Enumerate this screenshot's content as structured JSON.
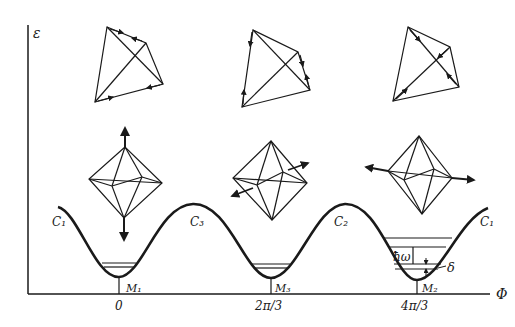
{
  "axes": {
    "y_label": "ε",
    "x_label": "Φ"
  },
  "ticks": [
    {
      "label": "0",
      "x": 119
    },
    {
      "label": "2π/3",
      "x": 271
    },
    {
      "label": "4π/3",
      "x": 417
    }
  ],
  "minima": [
    {
      "label": "M₁",
      "x": 119
    },
    {
      "label": "M₃",
      "x": 271
    },
    {
      "label": "M₂",
      "x": 417
    }
  ],
  "curve_labels": [
    {
      "label": "C₁",
      "position": "left"
    },
    {
      "label": "C₃",
      "position": "first-maximum"
    },
    {
      "label": "C₂",
      "position": "second-maximum"
    },
    {
      "label": "C₁",
      "position": "right"
    }
  ],
  "annotations": {
    "hbar_omega": "ħω",
    "delta": "δ"
  },
  "figures": {
    "top_row": [
      "tetrahedron-motion-1",
      "tetrahedron-motion-2",
      "tetrahedron-motion-3"
    ],
    "middle_row": [
      "octahedron-vertical-distortion",
      "octahedron-diagonal-distortion",
      "octahedron-horizontal-distortion"
    ]
  }
}
